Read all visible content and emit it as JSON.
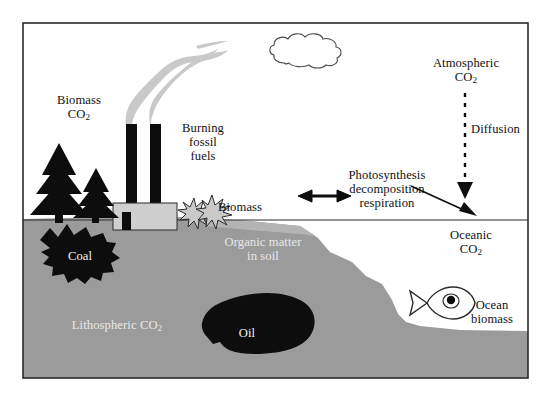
{
  "figure": {
    "kind": "carbon-cycle-diagram",
    "frame": {
      "border_color": "#2b2b2b",
      "background": "#ffffff"
    },
    "palette": {
      "land": "#9b9b9b",
      "soil_band": "#b0b0b0",
      "fossil_black": "#0d0d0d",
      "smoke_gray": "#c9c9c9",
      "factory_gray": "#cfcfcf",
      "ink": "#111111",
      "label_on_land": "#e8e8e8"
    }
  },
  "labels": {
    "biomass_co2_line1": "Biomass",
    "biomass_co2_line2_pre": "CO",
    "biomass_co2_line2_sub": "2",
    "burning_line1": "Burning",
    "burning_line2": "fossil",
    "burning_line3": "fuels",
    "biomass_shrub": "Biomass",
    "organic_matter_line1": "Organic matter",
    "organic_matter_line2": "in soil",
    "coal": "Coal",
    "oil": "Oil",
    "lithospheric_pre": "Lithospheric CO",
    "lithospheric_sub": "2",
    "photosynthesis_line1": "Photosynthesis",
    "photosynthesis_line2": "decomposition",
    "photosynthesis_line3": "respiration",
    "atmospheric_line1": "Atmospheric",
    "atmospheric_line2_pre": "CO",
    "atmospheric_line2_sub": "2",
    "diffusion": "Diffusion",
    "oceanic_line1": "Oceanic",
    "oceanic_line2_pre": "CO",
    "oceanic_line2_sub": "2",
    "ocean_biomass_line1": "Ocean",
    "ocean_biomass_line2": "biomass"
  },
  "icons": {
    "cloud": "cloud-icon",
    "tree_large": "conifer-tree-icon",
    "tree_small": "conifer-tree-icon",
    "smokestacks": "factory-smokestack-icon",
    "smoke_plume": "smoke-plume-icon",
    "shrub": "shrub-burst-icon",
    "coal_deposit": "coal-deposit-icon",
    "oil_deposit": "oil-deposit-icon",
    "fish": "fish-icon",
    "arrow_exchange": "double-headed-arrow-icon",
    "arrow_diffusion": "dashed-down-arrow-icon",
    "arrow_uptake": "diagonal-down-arrow-icon"
  }
}
